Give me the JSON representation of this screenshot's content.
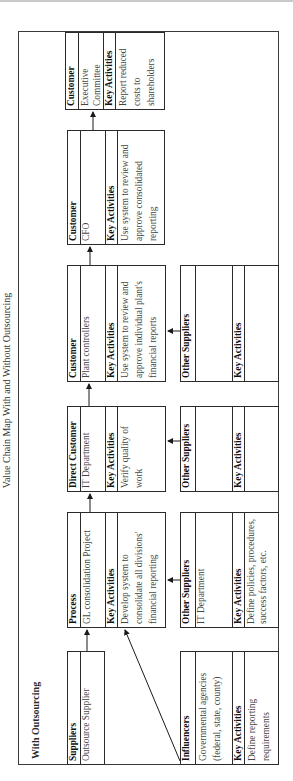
{
  "title": "Value Chain Map With and Without Outsourcing",
  "section_title": "With Outsourcing",
  "boxes": {
    "suppliers": {
      "heading": "Suppliers",
      "value": "Outsource Supplier"
    },
    "process": {
      "heading": "Process",
      "value": "GL consolidation Project",
      "activities_heading": "Key Activities",
      "activities": "Develop system to consolidate all divisions' financial reporting"
    },
    "direct_customer": {
      "heading": "Direct Customer",
      "value": "IT Department",
      "activities_heading": "Key Activities",
      "activities": "Verify quality of work"
    },
    "customer_plant": {
      "heading": "Customer",
      "value": "Plant controllers",
      "activities_heading": "Key Activities",
      "activities": "Use system to review and approve individual plant's financial reports"
    },
    "customer_cfo": {
      "heading": "Customer",
      "value": "CFO",
      "activities_heading": "Key Activities",
      "activities": "Use system to review and approve consolidated reporting"
    },
    "customer_exec": {
      "heading": "Customer",
      "value": "Executive Committee",
      "activities_heading": "Key Activities",
      "activities": "Report reduced costs to shareholders"
    },
    "influencers": {
      "heading": "Influencers",
      "value": "Governmental agencies (federal, state, county)",
      "activities_heading": "Key Activities",
      "activities": "Define reporting requirements"
    },
    "other_suppliers_it": {
      "heading": "Other Suppliers",
      "value": "IT Department",
      "activities_heading": "Key Activities",
      "activities": "Define policies, procedures, success factors, etc."
    },
    "other_suppliers_2": {
      "heading": "Other Suppliers",
      "value": "",
      "activities_heading": "Key Activities",
      "activities": ""
    },
    "other_suppliers_3": {
      "heading": "Other Suppliers",
      "value": "",
      "activities_heading": "Key Activities",
      "activities": ""
    }
  }
}
